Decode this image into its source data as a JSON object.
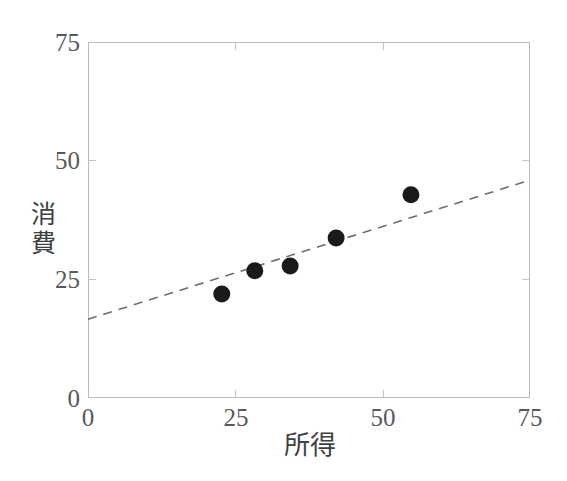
{
  "chart_data": {
    "type": "scatter",
    "title": "",
    "xlabel": "所得",
    "ylabel": "消費",
    "xlim": [
      0,
      75
    ],
    "ylim": [
      0,
      75
    ],
    "xticks": [
      0,
      25,
      50,
      75
    ],
    "yticks": [
      0,
      25,
      50,
      75
    ],
    "xtick_labels": [
      "0",
      "25",
      "50",
      "75"
    ],
    "ytick_labels": [
      "0",
      "25",
      "50",
      "75"
    ],
    "grid": false,
    "legend": null,
    "points": [
      {
        "x": 22.7,
        "y": 21.9
      },
      {
        "x": 28.3,
        "y": 26.8
      },
      {
        "x": 34.3,
        "y": 27.8
      },
      {
        "x": 42.1,
        "y": 33.7
      },
      {
        "x": 54.8,
        "y": 42.8
      }
    ],
    "series": [
      {
        "name": "消費",
        "type": "scatter",
        "x": [
          22.7,
          28.3,
          34.3,
          42.1,
          54.8
        ],
        "values": [
          21.9,
          26.8,
          27.8,
          33.7,
          42.8
        ],
        "marker": "filled-circle",
        "color": "#1a1a1a"
      },
      {
        "name": "回帰直線",
        "type": "line",
        "style": "dashed",
        "color": "#6b6d70",
        "x": [
          0,
          75
        ],
        "values": [
          16.6,
          45.9
        ]
      }
    ],
    "colors": {
      "point": "#1a1a1a",
      "trendline": "#6b6d70",
      "frame": "#b9bbbd",
      "tick_text": "#58595b",
      "axis_title": "#3d3f41",
      "background": "#ffffff"
    }
  },
  "axes": {
    "x": {
      "label": "所得",
      "ticks": [
        {
          "value": 0,
          "label": "0"
        },
        {
          "value": 25,
          "label": "25"
        },
        {
          "value": 50,
          "label": "50"
        },
        {
          "value": 75,
          "label": "75"
        }
      ]
    },
    "y": {
      "label": "消費",
      "label_chars": [
        "消",
        "費"
      ],
      "ticks": [
        {
          "value": 0,
          "label": "0"
        },
        {
          "value": 25,
          "label": "25"
        },
        {
          "value": 50,
          "label": "50"
        },
        {
          "value": 75,
          "label": "75"
        }
      ]
    }
  }
}
